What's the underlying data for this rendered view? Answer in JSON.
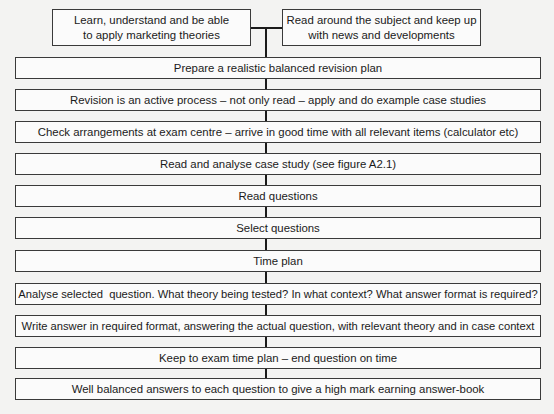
{
  "diagram": {
    "type": "flowchart",
    "top_inputs": [
      {
        "id": "learn",
        "lines": [
          "Learn, understand and be able",
          "to apply marketing theories"
        ]
      },
      {
        "id": "read-around",
        "lines": [
          "Read around the subject and keep up",
          "with news and developments"
        ]
      }
    ],
    "steps": [
      {
        "id": "revision-plan",
        "label": "Prepare a realistic balanced revision plan"
      },
      {
        "id": "active-revision",
        "label": "Revision is an active process – not only read – apply and do example case studies"
      },
      {
        "id": "check-arrangements",
        "label": "Check arrangements at exam centre – arrive in good time with all relevant items (calculator etc)"
      },
      {
        "id": "case-study",
        "label": "Read and analyse case study (see figure A2.1)"
      },
      {
        "id": "read-questions",
        "label": "Read questions"
      },
      {
        "id": "select-questions",
        "label": "Select questions"
      },
      {
        "id": "time-plan",
        "label": "Time plan"
      },
      {
        "id": "analyse-question",
        "label": "Analyse selected  question. What theory being tested? In what context? What answer format is required?"
      },
      {
        "id": "write-answer",
        "label": "Write answer in required format, answering the actual question, with relevant theory and in case context"
      },
      {
        "id": "keep-time",
        "label": "Keep to exam time plan – end question on time"
      },
      {
        "id": "well-balanced",
        "label": "Well balanced answers to each question to give a high mark earning answer-book"
      }
    ],
    "edges": [
      [
        "learn",
        "revision-plan"
      ],
      [
        "read-around",
        "revision-plan"
      ],
      [
        "revision-plan",
        "active-revision"
      ],
      [
        "active-revision",
        "check-arrangements"
      ],
      [
        "check-arrangements",
        "case-study"
      ],
      [
        "case-study",
        "read-questions"
      ],
      [
        "read-questions",
        "select-questions"
      ],
      [
        "select-questions",
        "time-plan"
      ],
      [
        "time-plan",
        "analyse-question"
      ],
      [
        "analyse-question",
        "write-answer"
      ],
      [
        "write-answer",
        "keep-time"
      ],
      [
        "keep-time",
        "well-balanced"
      ]
    ]
  }
}
